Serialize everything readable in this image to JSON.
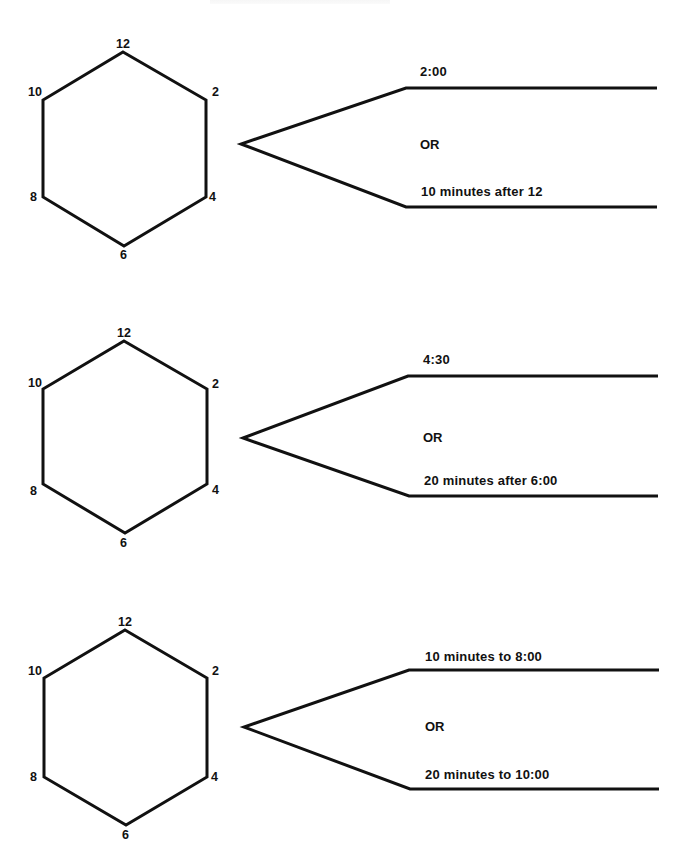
{
  "worksheet": {
    "exercises": [
      {
        "clock": {
          "labels": {
            "n12": "12",
            "n2": "2",
            "n4": "4",
            "n6": "6",
            "n8": "8",
            "n10": "10"
          }
        },
        "option_top": "2:00",
        "connector": "OR",
        "option_bottom": "10 minutes after 12"
      },
      {
        "clock": {
          "labels": {
            "n12": "12",
            "n2": "2",
            "n4": "4",
            "n6": "6",
            "n8": "8",
            "n10": "10"
          }
        },
        "option_top": "4:30",
        "connector": "OR",
        "option_bottom": "20 minutes after 6:00"
      },
      {
        "clock": {
          "labels": {
            "n12": "12",
            "n2": "2",
            "n4": "4",
            "n6": "6",
            "n8": "8",
            "n10": "10"
          }
        },
        "option_top": "10 minutes to 8:00",
        "connector": "OR",
        "option_bottom": "20 minutes to 10:00"
      }
    ]
  },
  "colors": {
    "ink": "#111111",
    "paper": "#ffffff"
  }
}
